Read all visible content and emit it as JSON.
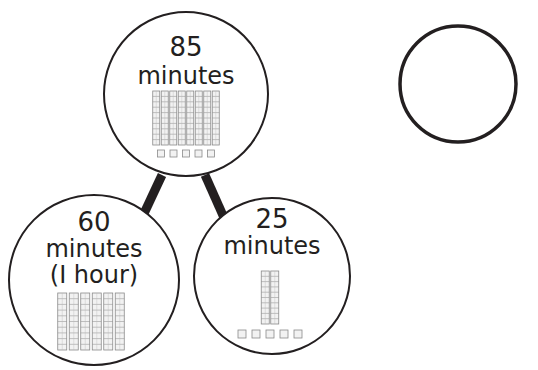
{
  "diagram": {
    "total": {
      "number": "85",
      "unit": "minutes",
      "rods": 8,
      "cubes": 5
    },
    "part_hours": {
      "number": "60",
      "unit": "minutes",
      "note": "(I hour)",
      "rods": 6,
      "cubes": 0
    },
    "part_minutes": {
      "number": "25",
      "unit": "minutes",
      "rods": 2,
      "cubes": 5
    }
  },
  "clocks": [
    {
      "id": "clock-top",
      "time": "12:00",
      "numerals": [
        "12",
        "1",
        "2",
        "3",
        "4",
        "5",
        "6",
        "7",
        "8",
        "q",
        "10",
        "II"
      ]
    },
    {
      "id": "clock-bottom",
      "time": "12:00",
      "numerals": [
        "12",
        "1",
        "2",
        "3",
        "4",
        "5",
        "6",
        "7",
        "8",
        "q",
        "10",
        "II"
      ]
    }
  ],
  "colors": {
    "ink": "#231f20",
    "cube_fill": "#f2f2f2",
    "cube_stroke": "#8a8a8a"
  }
}
